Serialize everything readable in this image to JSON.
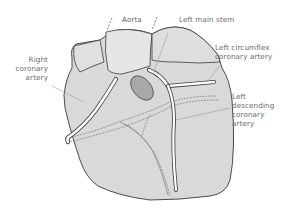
{
  "diagram": {
    "colors": {
      "heart_fill": "#d9d9d9",
      "heart_fill_light": "#e4e4e4",
      "outline": "#3a3a3a",
      "vessel": "#ffffff",
      "aortic_opening": "#a8a8a8",
      "leader_line": "#9a9a9a",
      "label_text": "#6a6a6a"
    },
    "labels": {
      "aorta": "Aorta",
      "left_main_stem": "Left main stem",
      "left_circumflex": [
        "Left circumflex",
        "coronary artery"
      ],
      "right_coronary": [
        "Right",
        "coronary",
        "artery"
      ],
      "left_descending": [
        "Left",
        "descending",
        "coronary",
        "artery"
      ]
    }
  }
}
